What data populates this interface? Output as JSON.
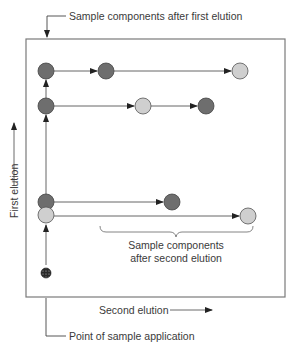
{
  "diagram": {
    "type": "two-dimensional chromatography schematic",
    "labels": {
      "top_callout": "Sample components after first elution",
      "y_axis": "First elution",
      "x_axis": "Second elution",
      "bracket_line1": "Sample components",
      "bracket_line2": "after second elution",
      "bottom_callout": "Point of sample application"
    },
    "colors": {
      "dark_spot": "#6e6e6e",
      "light_spot": "#cfcfcf",
      "line": "#555555",
      "frame": "#7a7a7a"
    },
    "rows": [
      {
        "y": 71,
        "spots": [
          {
            "x": 46,
            "tone": "dark"
          },
          {
            "x": 106,
            "tone": "dark"
          },
          {
            "x": 240,
            "tone": "light"
          }
        ]
      },
      {
        "y": 106,
        "spots": [
          {
            "x": 46,
            "tone": "dark"
          },
          {
            "x": 143,
            "tone": "light"
          },
          {
            "x": 206,
            "tone": "dark"
          }
        ]
      },
      {
        "y": 202,
        "spots": [
          {
            "x": 46,
            "tone": "dark"
          },
          {
            "x": 172,
            "tone": "dark"
          }
        ]
      },
      {
        "y": 216,
        "spots": [
          {
            "x": 46,
            "tone": "light"
          },
          {
            "x": 248,
            "tone": "light"
          }
        ]
      }
    ],
    "application_point": {
      "x": 46,
      "y": 273
    }
  }
}
